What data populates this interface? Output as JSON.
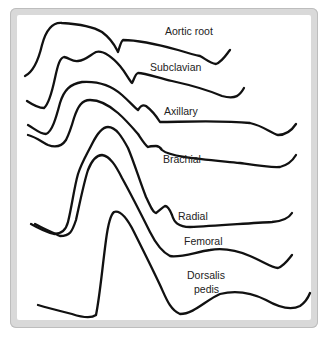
{
  "labels": {
    "aortic_root": "Aortic root",
    "subclavian": "Subclavian",
    "axillary": "Axillary",
    "brachial": "Brachial",
    "radial": "Radial",
    "femoral": "Femoral",
    "dorsalis_pedis_1": "Dorsalis",
    "dorsalis_pedis_2": "pedis"
  },
  "colors": {
    "stroke": "#111111",
    "frame": "#d9d9d9",
    "background": "#ffffff"
  }
}
